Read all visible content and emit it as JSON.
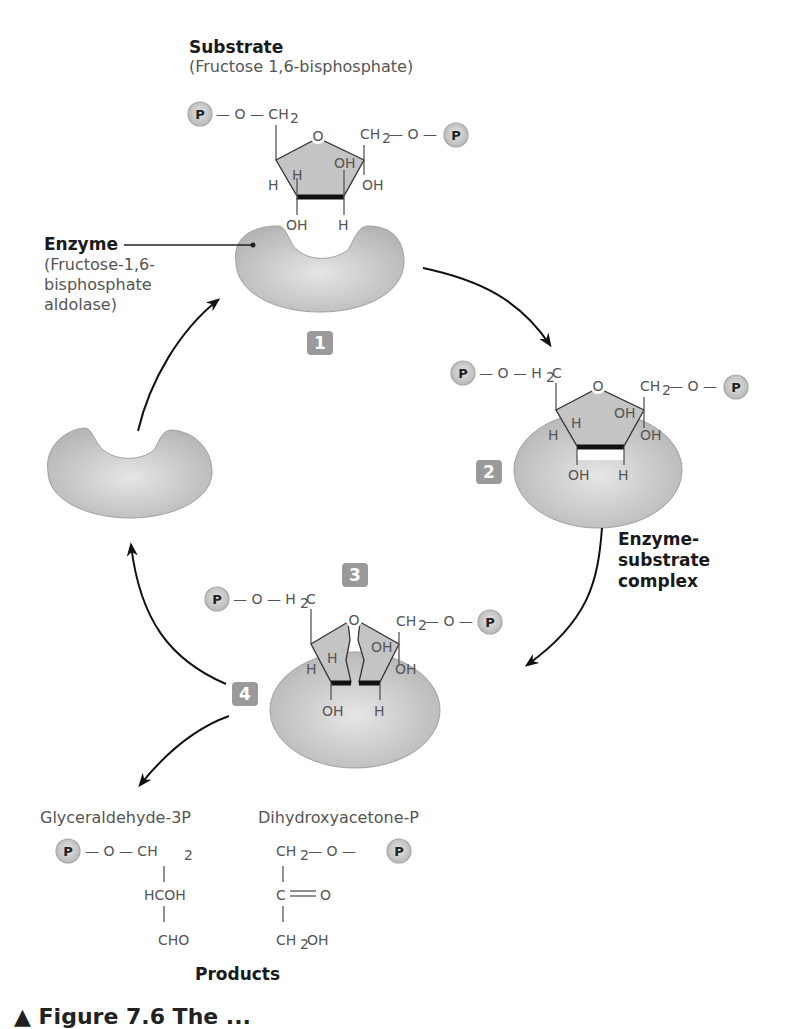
{
  "substrate": {
    "title": "Substrate",
    "name": "(Fructose 1,6-bisphosphate)"
  },
  "enzyme": {
    "title": "Enzyme",
    "name_lines": [
      "(Fructose-1,6-",
      "bisphosphate",
      "aldolase)"
    ]
  },
  "complex_label": {
    "lines": [
      "Enzyme-",
      "substrate",
      "complex"
    ]
  },
  "steps": [
    "1",
    "2",
    "3",
    "4"
  ],
  "phosphate_symbol": "P",
  "chem_labels": {
    "o": "O",
    "ch2": "CH",
    "h2c": "H",
    "sub2": "2",
    "c": "C",
    "oh": "OH",
    "h": "H",
    "bond_o": "— O —"
  },
  "products": {
    "title": "Products",
    "g3p": {
      "name": "Glyceraldehyde-3P",
      "lines": [
        "HCOH",
        "CHO"
      ]
    },
    "dhap": {
      "name": "Dihydroxyacetone-P",
      "lines": [
        "C",
        "= O",
        "CH",
        "OH"
      ]
    }
  },
  "caption": "▲ Figure 7.6 The ..."
}
